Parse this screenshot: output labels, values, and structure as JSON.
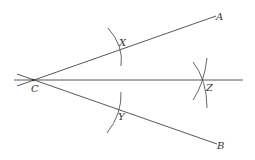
{
  "diagram": {
    "colors": {
      "line": "#444444",
      "arc": "#555555",
      "label": "#333333",
      "background": "#ffffff"
    },
    "points": {
      "C": {
        "label": "C",
        "x": 33,
        "y": 80
      },
      "A": {
        "label": "A",
        "x": 216,
        "y": 16
      },
      "B": {
        "label": "B",
        "x": 217,
        "y": 144
      },
      "X": {
        "label": "X",
        "x": 118,
        "y": 50
      },
      "Y": {
        "label": "Y",
        "x": 118,
        "y": 109
      },
      "Z": {
        "label": "Z",
        "x": 201,
        "y": 80
      }
    },
    "labels": {
      "A": "A",
      "B": "B",
      "C": "C",
      "X": "X",
      "Y": "Y",
      "Z": "Z"
    }
  }
}
